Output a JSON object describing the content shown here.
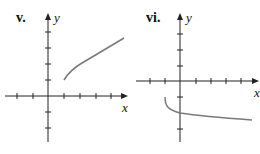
{
  "graphs": [
    {
      "label": "v.",
      "x_axis_label": "x",
      "y_axis_label": "y",
      "curve_color": "#7a7a7a",
      "description": "increasing curve starting at (1,1)"
    },
    {
      "label": "vi.",
      "x_axis_label": "x",
      "y_axis_label": "y",
      "curve_color": "#7a7a7a",
      "description": "decreasing curve starting at (-1,-1), passing (0,-2)"
    }
  ]
}
